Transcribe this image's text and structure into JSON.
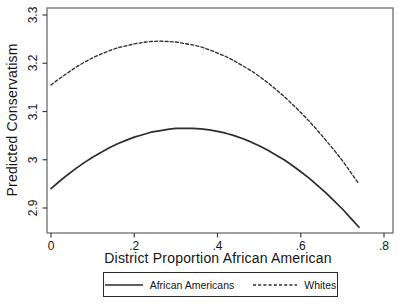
{
  "chart_data": {
    "type": "line",
    "title": "",
    "xlabel": "District Proportion African American",
    "ylabel": "Predicted Conservatism",
    "x_ticks": [
      {
        "value": 0.0,
        "label": "0"
      },
      {
        "value": 0.2,
        "label": ".2"
      },
      {
        "value": 0.4,
        "label": ".4"
      },
      {
        "value": 0.6,
        "label": ".6"
      },
      {
        "value": 0.8,
        "label": ".8"
      }
    ],
    "y_ticks": [
      {
        "value": 2.9,
        "label": "2.9"
      },
      {
        "value": 3.0,
        "label": "3"
      },
      {
        "value": 3.1,
        "label": "3.1"
      },
      {
        "value": 3.2,
        "label": "3.2"
      },
      {
        "value": 3.3,
        "label": "3.3"
      }
    ],
    "xlim": [
      -0.01,
      0.822
    ],
    "ylim": [
      2.848,
      3.315
    ],
    "grid": false,
    "legend_position": "bottom-center",
    "series": [
      {
        "name": "African Americans",
        "line_style": "solid",
        "color": "#2d2d2d",
        "x": [
          0,
          0.02,
          0.04,
          0.06,
          0.08,
          0.1,
          0.12,
          0.14,
          0.16,
          0.18,
          0.2,
          0.22,
          0.24,
          0.26,
          0.28,
          0.3,
          0.32,
          0.34,
          0.36,
          0.38,
          0.4,
          0.42,
          0.44,
          0.46,
          0.48,
          0.5,
          0.52,
          0.54,
          0.56,
          0.58,
          0.6,
          0.62,
          0.64,
          0.66,
          0.68,
          0.7,
          0.72,
          0.74
        ],
        "y": [
          2.94,
          2.955,
          2.969,
          2.982,
          2.994,
          3.005,
          3.015,
          3.025,
          3.033,
          3.04,
          3.047,
          3.052,
          3.057,
          3.06,
          3.063,
          3.065,
          3.065,
          3.065,
          3.064,
          3.062,
          3.059,
          3.055,
          3.05,
          3.044,
          3.037,
          3.029,
          3.02,
          3.01,
          3.0,
          2.988,
          2.975,
          2.962,
          2.947,
          2.932,
          2.915,
          2.898,
          2.879,
          2.86
        ]
      },
      {
        "name": "Whites",
        "line_style": "dashed",
        "color": "#2d2d2d",
        "x": [
          0,
          0.02,
          0.04,
          0.06,
          0.08,
          0.1,
          0.12,
          0.14,
          0.16,
          0.18,
          0.2,
          0.22,
          0.24,
          0.26,
          0.28,
          0.3,
          0.32,
          0.34,
          0.36,
          0.38,
          0.4,
          0.42,
          0.44,
          0.46,
          0.48,
          0.5,
          0.52,
          0.54,
          0.56,
          0.58,
          0.6,
          0.62,
          0.64,
          0.66,
          0.68,
          0.7,
          0.72,
          0.74
        ],
        "y": [
          3.155,
          3.168,
          3.18,
          3.192,
          3.202,
          3.211,
          3.219,
          3.226,
          3.232,
          3.236,
          3.24,
          3.243,
          3.245,
          3.246,
          3.245,
          3.244,
          3.241,
          3.238,
          3.234,
          3.228,
          3.221,
          3.214,
          3.205,
          3.195,
          3.185,
          3.173,
          3.16,
          3.146,
          3.131,
          3.115,
          3.098,
          3.08,
          3.061,
          3.041,
          3.02,
          2.998,
          2.974,
          2.95
        ]
      }
    ]
  },
  "colors": {
    "axis_border": "#6e6e6e",
    "tick": "#3c3c3c",
    "text": "#151515",
    "background": "#ffffff"
  }
}
